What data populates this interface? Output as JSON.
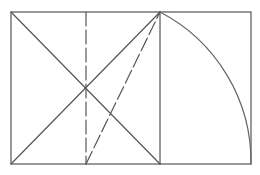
{
  "diagram": {
    "type": "golden-rectangle-construction",
    "stroke_color": "#555555",
    "background": "#ffffff",
    "rectangle": {
      "x": 11,
      "y": 12,
      "width": 240,
      "height": 152
    },
    "square_divider_x": 160,
    "midline_x": 86,
    "diagonal_intersection": {
      "x": 86,
      "y": 88
    },
    "arc": {
      "center": {
        "x": 86,
        "y": 164
      },
      "from": {
        "x": 160,
        "y": 12
      },
      "to": {
        "x": 251,
        "y": 164
      }
    }
  }
}
